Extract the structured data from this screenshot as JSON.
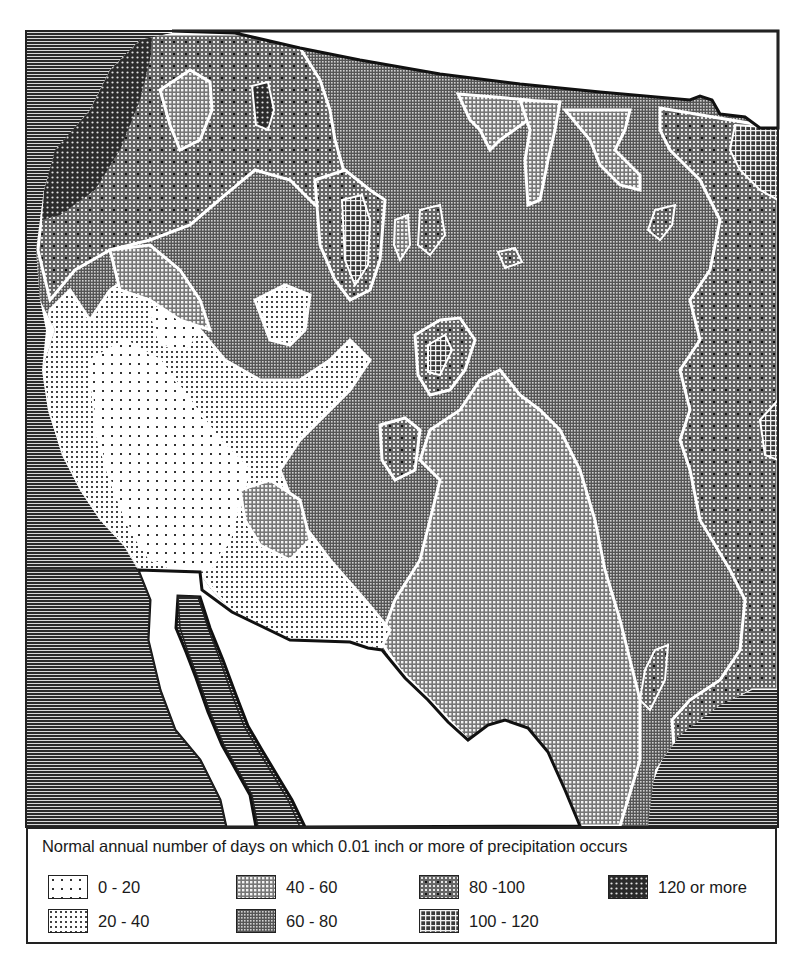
{
  "figure": {
    "type": "choropleth-contour-map",
    "region": "Western and south-central United States",
    "surrounding_areas": [
      {
        "name": "pacific-ocean",
        "style": "horizontal-hatch",
        "position": "west"
      },
      {
        "name": "gulf-of-mexico",
        "style": "horizontal-hatch",
        "position": "southeast"
      },
      {
        "name": "mexico",
        "style": "blank",
        "position": "south"
      },
      {
        "name": "canada",
        "style": "blank",
        "position": "north"
      },
      {
        "name": "gulf-of-california",
        "style": "blank",
        "position": "southwest"
      },
      {
        "name": "baja-california",
        "style": "horizontal-hatch",
        "position": "southwest"
      }
    ]
  },
  "legend": {
    "title": "Normal annual number of days on which 0.01 inch or more of precipitation occurs",
    "items": [
      {
        "label": "0 - 20",
        "pattern": "sparse-dots",
        "class_min": 0,
        "class_max": 20
      },
      {
        "label": "20 - 40",
        "pattern": "dense-dots",
        "class_min": 20,
        "class_max": 40
      },
      {
        "label": "40 - 60",
        "pattern": "light-grid",
        "class_min": 40,
        "class_max": 60
      },
      {
        "label": "60 - 80",
        "pattern": "fine-grid",
        "class_min": 60,
        "class_max": 80
      },
      {
        "label": "80 -100",
        "pattern": "grid-with-dots",
        "class_min": 80,
        "class_max": 100
      },
      {
        "label": "100 - 120",
        "pattern": "coarse-white-grid",
        "class_min": 100,
        "class_max": 120
      },
      {
        "label": "120 or more",
        "pattern": "dark-dot-screen",
        "class_min": 120,
        "class_max": null
      }
    ]
  },
  "colors": {
    "ink": "#1a1a1a",
    "paper": "#ffffff",
    "contour": "#ffffff",
    "ocean_hatch": "#2a2a2a"
  }
}
